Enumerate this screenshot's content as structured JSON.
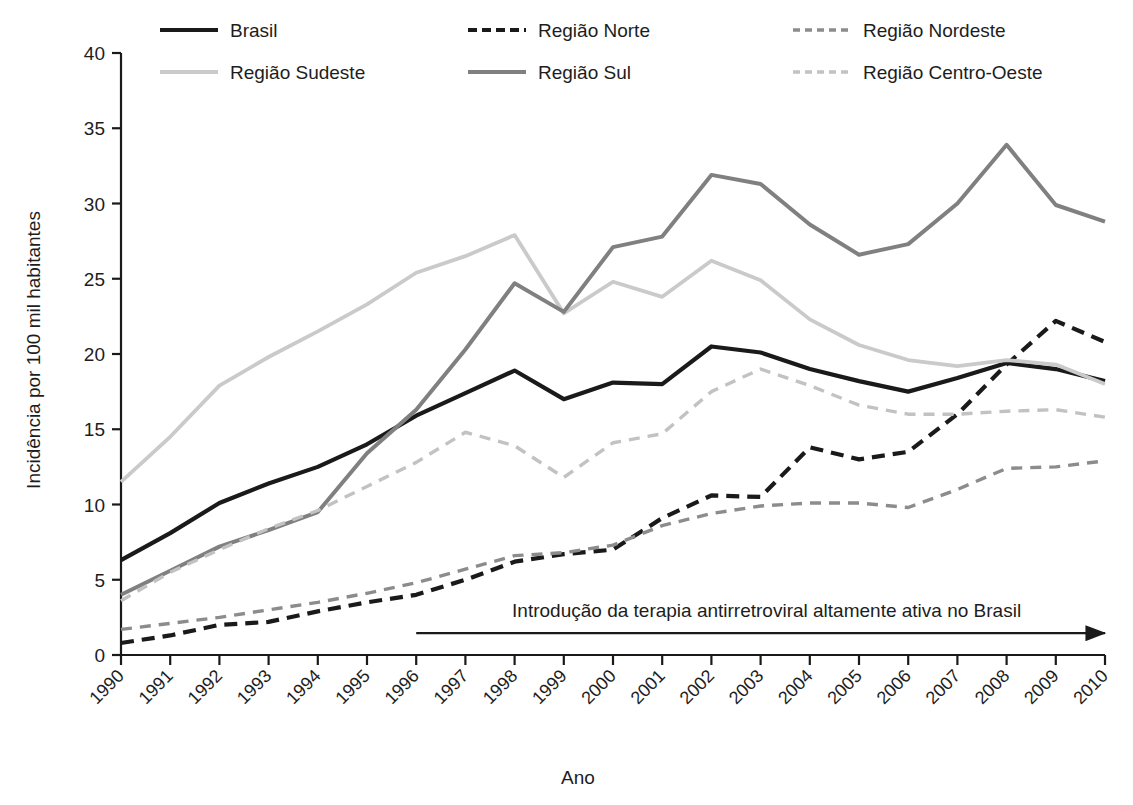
{
  "chart_data": {
    "type": "line",
    "title": "",
    "xlabel": "Ano",
    "ylabel": "Incidência por 100 mil habitantes",
    "xlim": [
      1990,
      2010
    ],
    "ylim": [
      0,
      40
    ],
    "ytick_values": [
      0,
      5,
      10,
      15,
      20,
      25,
      30,
      35,
      40
    ],
    "ytick_labels": [
      "0",
      "5",
      "10",
      "15",
      "20",
      "25",
      "30",
      "35",
      "40"
    ],
    "grid": false,
    "legend_position": "top",
    "categories": [
      "1990",
      "1991",
      "1992",
      "1993",
      "1994",
      "1995",
      "1996",
      "1997",
      "1998",
      "1999",
      "2000",
      "2001",
      "2002",
      "2003",
      "2004",
      "2005",
      "2006",
      "2007",
      "2008",
      "2009",
      "2010"
    ],
    "series": [
      {
        "name": "Brasil",
        "style": "solid",
        "color": "#1a1a1a",
        "width": 4.2,
        "values": [
          6.3,
          8.1,
          10.1,
          11.4,
          12.5,
          14.0,
          15.9,
          17.4,
          18.9,
          17.0,
          18.1,
          18.0,
          20.5,
          20.1,
          19.0,
          18.2,
          17.5,
          18.4,
          19.4,
          19.0,
          18.2
        ]
      },
      {
        "name": "Região Norte",
        "style": "dashed",
        "color": "#1a1a1a",
        "width": 4.2,
        "values": [
          0.8,
          1.3,
          2.0,
          2.2,
          2.9,
          3.5,
          4.0,
          5.0,
          6.2,
          6.7,
          7.0,
          9.1,
          10.6,
          10.5,
          13.8,
          13.0,
          13.5,
          16.0,
          19.3,
          22.2,
          20.8
        ]
      },
      {
        "name": "Região Nordeste",
        "style": "dashed",
        "color": "#8c8c8c",
        "width": 3.4,
        "values": [
          1.7,
          2.1,
          2.5,
          3.0,
          3.5,
          4.1,
          4.8,
          5.7,
          6.6,
          6.8,
          7.3,
          8.6,
          9.4,
          9.9,
          10.1,
          10.1,
          9.8,
          11.0,
          12.4,
          12.5,
          12.9
        ]
      },
      {
        "name": "Região Sudeste",
        "style": "solid",
        "color": "#cacaca",
        "width": 3.8,
        "values": [
          11.5,
          14.5,
          17.9,
          19.8,
          21.5,
          23.3,
          25.4,
          26.5,
          27.9,
          22.7,
          24.8,
          23.8,
          26.2,
          24.9,
          22.3,
          20.6,
          19.6,
          19.2,
          19.6,
          19.3,
          18.0
        ]
      },
      {
        "name": "Região Sul",
        "style": "solid",
        "color": "#808080",
        "width": 4.0,
        "values": [
          4.0,
          5.6,
          7.2,
          8.3,
          9.5,
          13.4,
          16.3,
          20.3,
          24.7,
          22.8,
          27.1,
          27.8,
          31.9,
          31.3,
          28.6,
          26.6,
          27.3,
          30.0,
          33.9,
          29.9,
          28.8
        ]
      },
      {
        "name": "Região Centro-Oeste",
        "style": "dashed",
        "color": "#c2c2c2",
        "width": 3.4,
        "values": [
          3.6,
          5.5,
          7.0,
          8.4,
          9.6,
          11.2,
          12.8,
          14.8,
          13.9,
          11.8,
          14.1,
          14.7,
          17.5,
          19.0,
          17.9,
          16.6,
          16.0,
          16.0,
          16.2,
          16.3,
          15.8
        ]
      }
    ],
    "annotations": [
      {
        "text": "Introdução da terapia antirretroviral altamente ativa no Brasil",
        "arrow_start_year": 1996,
        "arrow_end_year": 2010,
        "arrow_y": 1.45
      }
    ]
  },
  "legend": {
    "items": [
      {
        "label": "Brasil"
      },
      {
        "label": "Região Norte"
      },
      {
        "label": "Região Nordeste"
      },
      {
        "label": "Região Sudeste"
      },
      {
        "label": "Região Sul"
      },
      {
        "label": "Região Centro-Oeste"
      }
    ]
  }
}
